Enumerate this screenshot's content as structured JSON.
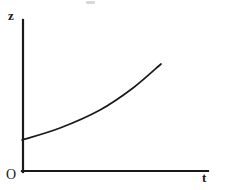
{
  "figure": {
    "title": "",
    "background_color": "#ffffff",
    "ink_color": "#1a1a1a",
    "width": 233,
    "height": 190
  },
  "labels": {
    "y_axis": "z",
    "x_axis": "t",
    "origin": "O"
  },
  "chart_data": {
    "type": "line",
    "title": "",
    "xlabel": "t",
    "ylabel": "z",
    "grid": false,
    "legend": null,
    "axis_style": "two-axis-origin-corner",
    "xlim": [
      0,
      1
    ],
    "ylim": [
      0,
      1
    ],
    "series": [
      {
        "name": "z(t)",
        "color": "#1a1a1a",
        "x": [
          0.0,
          0.2,
          0.41,
          0.57,
          0.74,
          0.9,
          1.0
        ],
        "y": [
          0.21,
          0.29,
          0.4,
          0.51,
          0.62,
          0.77,
          0.88
        ]
      }
    ],
    "pixel_points": [
      [
        22,
        140
      ],
      [
        60,
        128
      ],
      [
        100,
        110
      ],
      [
        133,
        88
      ],
      [
        161,
        64
      ]
    ]
  },
  "axes": {
    "y_axis_top_px": 20,
    "y_axis_x_px": 22,
    "x_axis_y_px": 171,
    "x_axis_right_px": 208
  }
}
